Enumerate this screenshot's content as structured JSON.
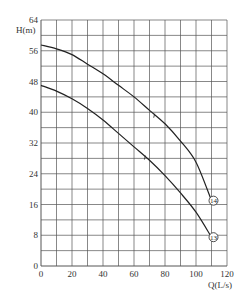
{
  "chart_data": {
    "type": "line",
    "title": "",
    "xlabel": "Q(L/s)",
    "ylabel": "H(m)",
    "xlim": [
      0,
      120
    ],
    "ylim": [
      0,
      64
    ],
    "x_ticks": [
      0,
      20,
      40,
      60,
      80,
      100,
      120
    ],
    "y_ticks": [
      0,
      8,
      16,
      24,
      32,
      40,
      48,
      56,
      64
    ],
    "x_grid_step": 10,
    "y_grid_step": 4,
    "grid": true,
    "legend": "none (series labelled by circled numbers at curve ends)",
    "x": [
      0,
      10,
      20,
      30,
      40,
      50,
      60,
      70,
      80,
      90,
      100,
      110
    ],
    "series": [
      {
        "name": "14",
        "label_circled": "14",
        "values": [
          57.5,
          56.5,
          55,
          52.5,
          50,
          47,
          44,
          40.5,
          37,
          32.5,
          27,
          17
        ]
      },
      {
        "name": "13",
        "label_circled": "13",
        "values": [
          47,
          45.5,
          43.5,
          41,
          38,
          34.5,
          31,
          27.5,
          23.5,
          19,
          14,
          7.5
        ]
      }
    ]
  },
  "labels": {
    "y_axis": "H(m)",
    "x_axis": "Q(L/s)",
    "series_14": "14",
    "series_13": "13"
  },
  "colors": {
    "grid": "#555555",
    "curve": "#222222",
    "text": "#333333",
    "background": "#ffffff"
  }
}
